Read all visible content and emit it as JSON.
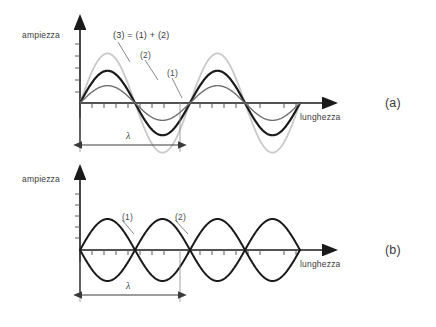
{
  "figure": {
    "background": "#ffffff",
    "panels": [
      {
        "id": "a",
        "tag": "(a)",
        "y_axis_label": "ampiezza",
        "x_axis_label": "lunghezza",
        "lambda_label": "λ",
        "caption_sum": "(3) = (1) + (2)",
        "curve_labels": [
          "(1)",
          "(2)"
        ],
        "description": "constructive interference of two in-phase waves"
      },
      {
        "id": "b",
        "tag": "(b)",
        "y_axis_label": "ampiezza",
        "x_axis_label": "lunghezza",
        "lambda_label": "λ",
        "curve_labels": [
          "(1)",
          "(2)"
        ],
        "description": "destructive interference of two anti-phase waves"
      }
    ]
  },
  "chart_data": [
    {
      "type": "line",
      "panel": "a",
      "title": "(3) = (1) + (2)",
      "xlabel": "lunghezza",
      "ylabel": "ampiezza",
      "xlim": [
        0,
        2
      ],
      "ylim": [
        -1.0,
        1.0
      ],
      "grid": false,
      "x_unit": "wavelengths",
      "wavelength": 1,
      "cycles_drawn": 2,
      "annotations": [
        "λ spans 0 to 1 wavelength"
      ],
      "series": [
        {
          "name": "(1)",
          "amplitude": 0.28,
          "phase_deg": 0,
          "color": "#707070",
          "width": 1.4
        },
        {
          "name": "(2)",
          "amplitude": 0.52,
          "phase_deg": 0,
          "color": "#1a1a1a",
          "width": 2.2
        },
        {
          "name": "(3)",
          "amplitude": 0.8,
          "phase_deg": 0,
          "color": "#c9c9c9",
          "width": 1.8
        }
      ]
    },
    {
      "type": "line",
      "panel": "b",
      "title": "",
      "xlabel": "lunghezza",
      "ylabel": "ampiezza",
      "xlim": [
        0,
        2
      ],
      "ylim": [
        -1.0,
        1.0
      ],
      "grid": false,
      "x_unit": "wavelengths",
      "wavelength": 1,
      "cycles_drawn": 2,
      "annotations": [
        "λ spans 0 to 1 wavelength"
      ],
      "series": [
        {
          "name": "(1)",
          "amplitude": 0.5,
          "phase_deg": 0,
          "color": "#1a1a1a",
          "width": 2.0
        },
        {
          "name": "(2)",
          "amplitude": 0.5,
          "phase_deg": 180,
          "color": "#1a1a1a",
          "width": 2.0
        }
      ]
    }
  ]
}
